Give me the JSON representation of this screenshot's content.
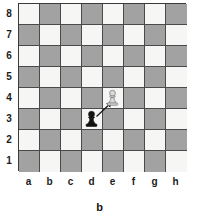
{
  "figure": {
    "caption": "b",
    "type": "chess-diagram"
  },
  "board": {
    "files": [
      "a",
      "b",
      "c",
      "d",
      "e",
      "f",
      "g",
      "h"
    ],
    "ranks": [
      "8",
      "7",
      "6",
      "5",
      "4",
      "3",
      "2",
      "1"
    ],
    "light_square_color": "#f6f6f4",
    "dark_square_color": "#a2a2a2",
    "border_color": "#3a3a3a",
    "grid_line_color": "#4a4a4a",
    "orientation": "white-bottom",
    "square_size_px": 21,
    "a8_is_light": true
  },
  "pieces": [
    {
      "id": "white-pawn-e4",
      "type": "pawn",
      "color": "white",
      "square": "e4",
      "file_index": 4,
      "rank_index": 4,
      "fill": "#d7d7d7",
      "stroke": "#8f8f8f",
      "label": "white pawn on e4"
    },
    {
      "id": "black-pawn-d3",
      "type": "pawn",
      "color": "black",
      "square": "d3",
      "file_index": 3,
      "rank_index": 5,
      "fill": "#141414",
      "stroke": "#141414",
      "label": "black pawn on d3"
    }
  ],
  "annotations": [
    {
      "id": "move-arrow-d3-e4",
      "kind": "arrow",
      "from_square": "d3",
      "to_square": "e4",
      "color": "#1a1a1a",
      "label": "capture arrow from d3 to e4"
    }
  ],
  "chart_data": {
    "type": "table",
    "title": "b",
    "xlabel": "files",
    "ylabel": "ranks",
    "categories": [
      "a",
      "b",
      "c",
      "d",
      "e",
      "f",
      "g",
      "h"
    ],
    "rows": [
      "8",
      "7",
      "6",
      "5",
      "4",
      "3",
      "2",
      "1"
    ],
    "values": [
      [
        "",
        "",
        "",
        "",
        "",
        "",
        "",
        ""
      ],
      [
        "",
        "",
        "",
        "",
        "",
        "",
        "",
        ""
      ],
      [
        "",
        "",
        "",
        "",
        "",
        "",
        "",
        ""
      ],
      [
        "",
        "",
        "",
        "",
        "",
        "",
        "",
        ""
      ],
      [
        "",
        "",
        "",
        "",
        "P",
        "",
        "",
        ""
      ],
      [
        "",
        "",
        "",
        "p",
        "",
        "",
        "",
        ""
      ],
      [
        "",
        "",
        "",
        "",
        "",
        "",
        "",
        ""
      ],
      [
        "",
        "",
        "",
        "",
        "",
        "",
        "",
        ""
      ]
    ],
    "annotations": [
      "arrow d3 to e4"
    ],
    "grid": true,
    "legend": "none"
  }
}
